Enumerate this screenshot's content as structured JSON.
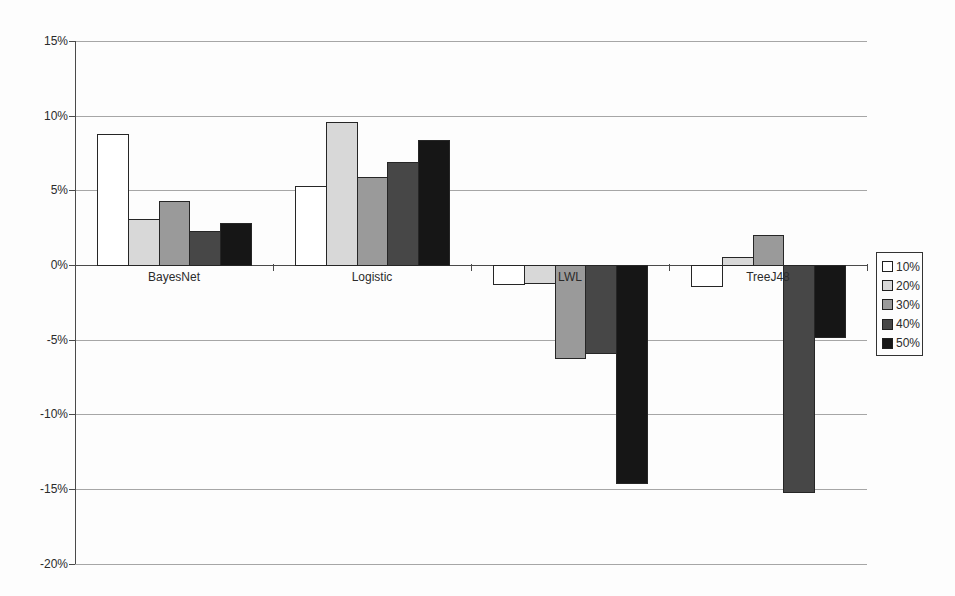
{
  "chart_data": {
    "type": "bar",
    "title": "",
    "xlabel": "",
    "ylabel": "",
    "categories": [
      "BayesNet",
      "Logistic",
      "LWL",
      "TreeJ48"
    ],
    "series": [
      {
        "name": "10%",
        "color": "#ffffff",
        "values": [
          8.8,
          5.3,
          -1.3,
          -1.4
        ]
      },
      {
        "name": "20%",
        "color": "#d8d8d8",
        "values": [
          3.1,
          9.6,
          -1.2,
          0.5
        ]
      },
      {
        "name": "30%",
        "color": "#9a9a9a",
        "values": [
          4.3,
          5.9,
          -6.2,
          2.0
        ]
      },
      {
        "name": "40%",
        "color": "#474747",
        "values": [
          2.3,
          6.9,
          -5.9,
          -15.2
        ]
      },
      {
        "name": "50%",
        "color": "#161616",
        "values": [
          2.8,
          8.4,
          -14.6,
          -4.8
        ]
      }
    ],
    "ylim": [
      -20,
      15
    ],
    "ytick_step": 5,
    "ytick_labels": [
      "15%",
      "10%",
      "5%",
      "0%",
      "-5%",
      "-10%",
      "-15%",
      "-20%"
    ],
    "grid": true,
    "legend_position": "right",
    "colors": {
      "gridline": "#a6a6a6",
      "zero_axis": "#4a4a4a",
      "bar_border": "#262626",
      "text": "#2b2b2b",
      "background": "#fdfdfd"
    }
  }
}
